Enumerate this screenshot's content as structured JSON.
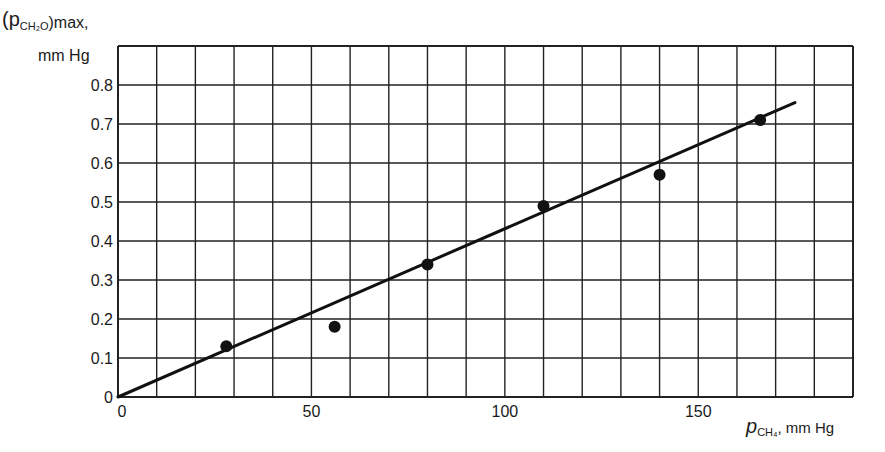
{
  "chart_data": {
    "type": "scatter",
    "title": "",
    "ylabel": "(p_CH2O)max, mm Hg",
    "ylabel_line1": "(p",
    "ylabel_sub": "CH₂O",
    "ylabel_tail": ")max,",
    "ylabel_line2": "mm Hg",
    "xlabel": "p_CH4, mm Hg",
    "xlabel_main": "p",
    "xlabel_sub": "CH₄",
    "xlabel_tail": ", mm Hg",
    "xlim": [
      0,
      190
    ],
    "ylim": [
      0,
      0.9
    ],
    "x_ticks": [
      0,
      50,
      100,
      150
    ],
    "x_tick_labels": [
      "0",
      "50",
      "100",
      "150"
    ],
    "y_ticks": [
      0,
      0.1,
      0.2,
      0.3,
      0.4,
      0.5,
      0.6,
      0.7,
      0.8
    ],
    "y_tick_labels": [
      "0",
      "0.1",
      "0.2",
      "0.3",
      "0.4",
      "0.5",
      "0.6",
      "0.7",
      "0.8"
    ],
    "grid": true,
    "grid_x_step": 10,
    "grid_y_step": 0.1,
    "legend": null,
    "series": [
      {
        "name": "measured",
        "type": "scatter",
        "x": [
          28,
          56,
          80,
          110,
          140,
          166
        ],
        "y": [
          0.13,
          0.18,
          0.34,
          0.49,
          0.57,
          0.71
        ]
      },
      {
        "name": "linear fit",
        "type": "line",
        "x": [
          0,
          175
        ],
        "y": [
          0,
          0.755
        ]
      }
    ]
  }
}
